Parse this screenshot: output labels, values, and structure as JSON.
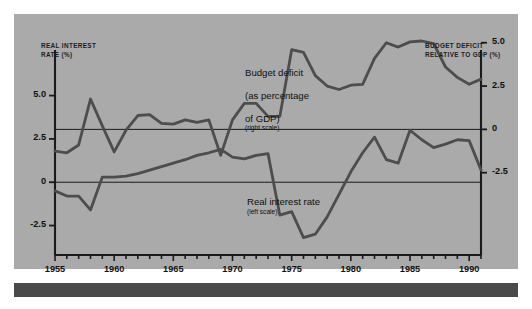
{
  "figure": {
    "background_color": "#aaaaaa",
    "series_color": "#4d4d4d",
    "axis_color": "#1a1a1a"
  },
  "axes": {
    "left": {
      "title": "REAL INTEREST\nRATE (%)",
      "ticks": [
        "5.0",
        "2.5",
        "0",
        "-2.5"
      ],
      "tick_values": [
        5.0,
        2.5,
        0,
        -2.5
      ]
    },
    "right": {
      "title": "BUDGET DEFICIT\nRELATIVE TO GDP (%)",
      "ticks": [
        "5.0",
        "2.5",
        "0",
        "-2.5"
      ],
      "tick_values": [
        5.0,
        2.5,
        0,
        -2.5
      ]
    },
    "x": {
      "ticks": [
        "1955",
        "1960",
        "1965",
        "1970",
        "1975",
        "1980",
        "1985",
        "1990"
      ],
      "tick_values": [
        1955,
        1960,
        1965,
        1970,
        1975,
        1980,
        1985,
        1990
      ]
    }
  },
  "annotations": {
    "deficit": {
      "line1": "Budget deficit",
      "line2": "(as percentage",
      "line3": "of GDP)",
      "scale": "(right scale)"
    },
    "rate": {
      "line1": "Real interest rate",
      "scale": "(left scale)"
    }
  },
  "chart_data": {
    "type": "line",
    "title": "",
    "xlabel": "",
    "ylabel": "REAL INTEREST RATE (%)",
    "y2label": "BUDGET DEFICIT RELATIVE TO GDP (%)",
    "grid": false,
    "legend": "inline-annotations",
    "xlim": [
      1955,
      1991
    ],
    "ylim": [
      -4.2,
      7.4
    ],
    "y2lim": [
      -4.2,
      7.4
    ],
    "x": [
      1955,
      1956,
      1957,
      1958,
      1959,
      1960,
      1961,
      1962,
      1963,
      1964,
      1965,
      1966,
      1967,
      1968,
      1969,
      1970,
      1971,
      1972,
      1973,
      1974,
      1975,
      1976,
      1977,
      1978,
      1979,
      1980,
      1981,
      1982,
      1983,
      1984,
      1985,
      1986,
      1987,
      1988,
      1989,
      1990,
      1991
    ],
    "series": [
      {
        "name": "Real interest rate",
        "scale": "left",
        "label": "Real interest rate (left scale)",
        "values": [
          -0.5,
          -0.8,
          -0.8,
          -1.6,
          0.3,
          0.3,
          0.35,
          0.5,
          0.7,
          0.9,
          1.1,
          1.3,
          1.55,
          1.7,
          1.9,
          1.45,
          1.35,
          1.55,
          1.65,
          -1.9,
          -1.7,
          -3.2,
          -3.0,
          -2.0,
          -0.7,
          0.6,
          1.7,
          2.6,
          1.3,
          1.1,
          3.0,
          2.45,
          2.0,
          2.2,
          2.45,
          2.4,
          0.7
        ]
      },
      {
        "name": "Budget deficit relative to GDP",
        "scale": "right",
        "label": "Budget deficit (as percentage of GDP) (right scale)",
        "values": [
          -1.25,
          -1.35,
          -0.9,
          1.75,
          0.2,
          -1.3,
          -0.05,
          0.8,
          0.85,
          0.35,
          0.3,
          0.55,
          0.4,
          0.55,
          -1.5,
          0.55,
          1.5,
          1.5,
          0.75,
          0.75,
          4.6,
          4.45,
          3.1,
          2.5,
          2.3,
          2.55,
          2.6,
          4.1,
          5.0,
          4.75,
          5.05,
          5.1,
          4.95,
          3.6,
          3.0,
          2.6,
          2.9
        ]
      }
    ]
  }
}
